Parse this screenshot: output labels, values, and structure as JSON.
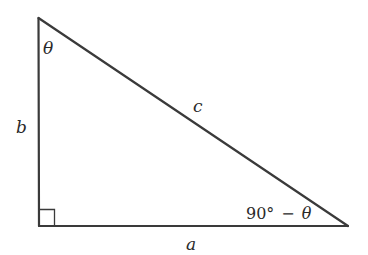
{
  "diagram": {
    "type": "right-triangle",
    "stroke_color": "#3a3a3a",
    "vertices": {
      "top": [
        38,
        18
      ],
      "right_angle": [
        39,
        226
      ],
      "bottom_right": [
        348,
        226
      ]
    },
    "labels": {
      "hypotenuse": "c",
      "vertical_leg": "b",
      "horizontal_leg": "a",
      "top_angle": "θ",
      "bottom_angle_num": "90°",
      "bottom_angle_op": "−",
      "bottom_angle_var": "θ"
    }
  }
}
